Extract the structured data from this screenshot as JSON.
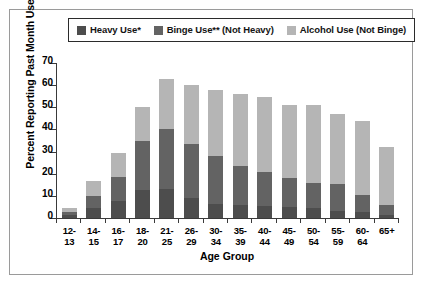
{
  "chart_data": {
    "type": "bar",
    "subtype": "stacked",
    "title": "",
    "xlabel": "Age Group",
    "ylabel": "Percent Reporting Past Month Use",
    "ylim": [
      0,
      70
    ],
    "yticks": [
      0,
      10,
      20,
      30,
      40,
      50,
      60,
      70
    ],
    "grid": false,
    "legend_position": "top",
    "categories": [
      "12-13",
      "14-15",
      "16-17",
      "18-20",
      "21-25",
      "26-29",
      "30-34",
      "35-39",
      "40-44",
      "45-49",
      "50-54",
      "55-59",
      "60-64",
      "65+"
    ],
    "category_lines": [
      [
        "12-",
        "13"
      ],
      [
        "14-",
        "15"
      ],
      [
        "16-",
        "17"
      ],
      [
        "18-",
        "20"
      ],
      [
        "21-",
        "25"
      ],
      [
        "26-",
        "29"
      ],
      [
        "30-",
        "34"
      ],
      [
        "35-",
        "39"
      ],
      [
        "40-",
        "44"
      ],
      [
        "45-",
        "49"
      ],
      [
        "50-",
        "54"
      ],
      [
        "55-",
        "59"
      ],
      [
        "60-",
        "64"
      ],
      [
        "65+",
        ""
      ]
    ],
    "series": [
      {
        "name": "Heavy Use*",
        "color": "#4d4d4d",
        "values": [
          1.5,
          4.5,
          7.5,
          12.5,
          13.0,
          9.0,
          6.5,
          6.0,
          5.5,
          5.0,
          4.5,
          3.0,
          2.5,
          1.5
        ]
      },
      {
        "name": "Binge Use** (Not Heavy)",
        "color": "#636363",
        "values": [
          1.0,
          5.5,
          11.0,
          22.5,
          27.0,
          24.5,
          21.5,
          17.5,
          15.5,
          13.0,
          11.5,
          12.5,
          8.0,
          4.5
        ]
      },
      {
        "name": "Alcohol Use (Not Binge)",
        "color": "#b5b5b5",
        "values": [
          2.0,
          6.5,
          11.0,
          15.0,
          23.0,
          26.5,
          30.0,
          32.5,
          33.5,
          33.0,
          35.0,
          31.5,
          33.5,
          26.0
        ]
      }
    ],
    "totals": [
      4.5,
      16.5,
      29.5,
      50.0,
      63.0,
      60.0,
      58.0,
      56.0,
      54.5,
      51.0,
      51.0,
      47.0,
      44.0,
      32.0
    ]
  },
  "legend": {
    "entries": [
      {
        "label": "Heavy Use*",
        "swatch": "#4d4d4d"
      },
      {
        "label": "Binge Use** (Not Heavy)",
        "swatch": "#636363"
      },
      {
        "label": "Alcohol Use (Not Binge)",
        "swatch": "#b5b5b5"
      }
    ]
  }
}
